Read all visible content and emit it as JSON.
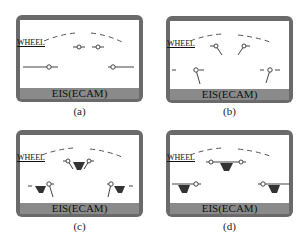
{
  "figure": {
    "panels": [
      {
        "id": "a",
        "caption": "(a)",
        "wheel_label": "WHEEL",
        "bar_label": "EIS(ECAM)",
        "state": "gear-retracted-doors-closed"
      },
      {
        "id": "b",
        "caption": "(b)",
        "wheel_label": "WHEEL",
        "bar_label": "EIS(ECAM)",
        "state": "doors-open"
      },
      {
        "id": "c",
        "caption": "(c)",
        "wheel_label": "WHEEL",
        "bar_label": "EIS(ECAM)",
        "state": "doors-open-gear-down"
      },
      {
        "id": "d",
        "caption": "(d)",
        "wheel_label": "WHEEL",
        "bar_label": "EIS(ECAM)",
        "state": "gear-down-doors-closed"
      }
    ],
    "colors": {
      "frame": "#6a6a6a",
      "bar": "#8a8a8a",
      "screen": "#ffffff",
      "symbol": "#333333"
    }
  }
}
